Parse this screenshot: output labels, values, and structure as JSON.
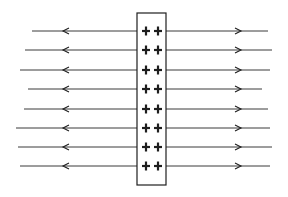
{
  "diagram": {
    "title": "",
    "colors": {
      "ink": "#1e1e1e",
      "line": "#3a3a3a",
      "background": "#ffffff"
    },
    "plate": {
      "x": 137,
      "y": 13,
      "width": 29,
      "height": 172,
      "charge_symbol": "+",
      "columns": 2
    },
    "rows": [
      {
        "y": 31,
        "left_start": 32,
        "right_end": 268,
        "charges": [
          "+",
          "+"
        ]
      },
      {
        "y": 50,
        "left_start": 25,
        "right_end": 272,
        "charges": [
          "+",
          "+"
        ]
      },
      {
        "y": 70,
        "left_start": 20,
        "right_end": 270,
        "charges": [
          "+",
          "+"
        ]
      },
      {
        "y": 89,
        "left_start": 28,
        "right_end": 262,
        "charges": [
          "+",
          "+"
        ]
      },
      {
        "y": 109,
        "left_start": 24,
        "right_end": 268,
        "charges": [
          "+",
          "+"
        ]
      },
      {
        "y": 128,
        "left_start": 16,
        "right_end": 270,
        "charges": [
          "+",
          "+"
        ]
      },
      {
        "y": 147,
        "left_start": 18,
        "right_end": 272,
        "charges": [
          "+",
          "+"
        ]
      },
      {
        "y": 166,
        "left_start": 20,
        "right_end": 270,
        "charges": [
          "+",
          "+"
        ]
      }
    ],
    "arrows": {
      "left_x": 63,
      "right_x": 241,
      "left_direction": "left",
      "right_direction": "right"
    }
  }
}
